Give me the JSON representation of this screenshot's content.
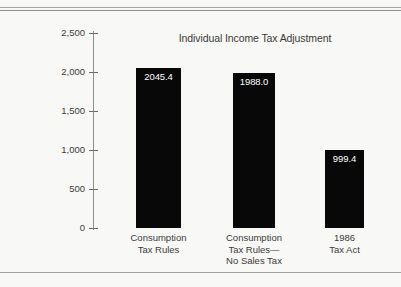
{
  "figure": {
    "background_color": "#f8f8f6",
    "rule_color": "#9a9a98"
  },
  "chart_data": {
    "type": "bar",
    "title": "Individual Income Tax Adjustment",
    "xlabel": "",
    "ylabel": "",
    "categories": [
      "Consumption Tax Rules",
      "Consumption Tax Rules— No Sales Tax",
      "1986 Tax Act"
    ],
    "category_lines": [
      [
        "Consumption",
        "Tax Rules"
      ],
      [
        "Consumption",
        "Tax Rules—",
        "No Sales Tax"
      ],
      [
        "1986",
        "Tax Act"
      ]
    ],
    "values": [
      2045.4,
      1988.0,
      999.4
    ],
    "value_labels": [
      "2045.4",
      "1988.0",
      "999.4"
    ],
    "ylim": [
      0,
      2500
    ],
    "yticks": [
      0,
      500,
      1000,
      1500,
      2000,
      2500
    ],
    "ytick_labels": [
      "0",
      "500",
      "1,000",
      "1,500",
      "2,000",
      "2,500"
    ],
    "grid": false,
    "legend": false,
    "bar_color": "#080808",
    "value_label_color": "#ffffff"
  }
}
